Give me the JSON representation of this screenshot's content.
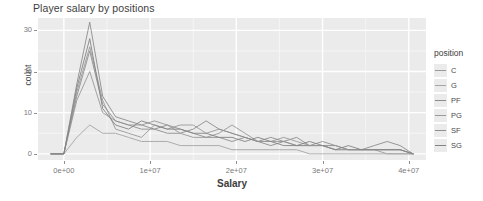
{
  "chart_data": {
    "type": "line",
    "title": "Player salary by positions",
    "xlabel": "Salary",
    "ylabel": "count",
    "xlim": [
      -3000000,
      42000000
    ],
    "ylim": [
      -1.5,
      33
    ],
    "grid": true,
    "legend_position": "right",
    "legend_title": "position",
    "x_ticks": [
      {
        "value": 0,
        "label": "0e+00"
      },
      {
        "value": 10000000,
        "label": "1e+07"
      },
      {
        "value": 20000000,
        "label": "2e+07"
      },
      {
        "value": 30000000,
        "label": "3e+07"
      },
      {
        "value": 40000000,
        "label": "4e+07"
      }
    ],
    "y_ticks": [
      {
        "value": 0,
        "label": "0"
      },
      {
        "value": 10,
        "label": "10"
      },
      {
        "value": 20,
        "label": "20"
      },
      {
        "value": 30,
        "label": "30"
      }
    ],
    "x": [
      -1500000,
      0,
      1500000,
      3000000,
      4500000,
      6000000,
      7500000,
      9000000,
      10500000,
      12000000,
      13500000,
      15000000,
      16500000,
      18000000,
      19500000,
      21000000,
      22500000,
      24000000,
      25500000,
      27000000,
      28500000,
      30000000,
      31500000,
      33000000,
      34500000,
      36000000,
      37500000,
      39000000,
      40500000
    ],
    "series": [
      {
        "name": "C",
        "color": "#9a9a9a",
        "values": [
          0,
          0,
          15,
          26,
          13,
          6,
          5,
          4,
          7,
          6,
          7,
          7,
          5,
          6,
          5,
          4,
          3,
          3,
          3,
          2,
          2,
          2,
          1,
          1,
          1,
          1,
          0,
          0,
          0
        ]
      },
      {
        "name": "G",
        "color": "#a5a5a5",
        "values": [
          0,
          0,
          4,
          7,
          5,
          5,
          4,
          3,
          3,
          3,
          2,
          2,
          2,
          2,
          1,
          1,
          1,
          1,
          1,
          1,
          0,
          0,
          0,
          0,
          0,
          0,
          0,
          0,
          0
        ]
      },
      {
        "name": "PF",
        "color": "#8c8c8c",
        "values": [
          0,
          0,
          17,
          32,
          14,
          9,
          8,
          7,
          6,
          5,
          5,
          6,
          8,
          6,
          5,
          4,
          3,
          2,
          3,
          4,
          2,
          2,
          2,
          1,
          1,
          2,
          3,
          2,
          0
        ]
      },
      {
        "name": "PG",
        "color": "#999999",
        "values": [
          0,
          0,
          13,
          20,
          10,
          8,
          7,
          7,
          8,
          7,
          5,
          4,
          4,
          5,
          7,
          5,
          3,
          3,
          4,
          3,
          2,
          2,
          1,
          1,
          1,
          1,
          1,
          1,
          0
        ]
      },
      {
        "name": "SF",
        "color": "#8f8f8f",
        "values": [
          0,
          0,
          14,
          25,
          12,
          8,
          7,
          6,
          6,
          7,
          6,
          5,
          4,
          4,
          3,
          4,
          3,
          4,
          3,
          2,
          2,
          3,
          2,
          1,
          1,
          1,
          1,
          1,
          0
        ]
      },
      {
        "name": "SG",
        "color": "#838383",
        "values": [
          0,
          0,
          16,
          28,
          11,
          7,
          6,
          8,
          7,
          6,
          6,
          5,
          5,
          4,
          4,
          3,
          4,
          3,
          2,
          2,
          3,
          2,
          1,
          2,
          1,
          1,
          1,
          1,
          0
        ]
      }
    ]
  },
  "legend": {
    "title": "position",
    "items": [
      {
        "label": "C"
      },
      {
        "label": "G"
      },
      {
        "label": "PF"
      },
      {
        "label": "PG"
      },
      {
        "label": "SF"
      },
      {
        "label": "SG"
      }
    ]
  }
}
